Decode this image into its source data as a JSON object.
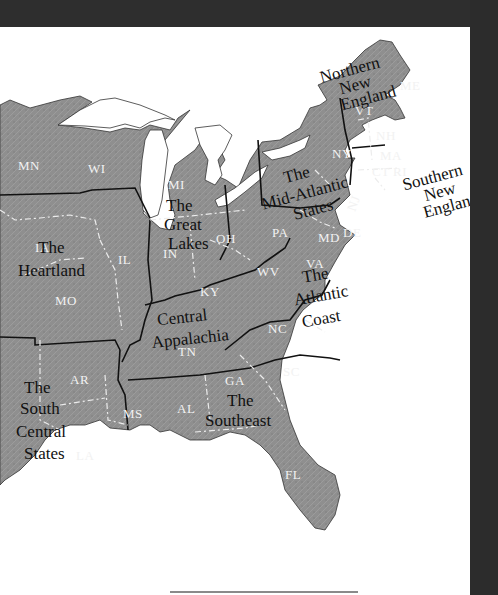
{
  "map": {
    "title": "Regions of the Eastern United States",
    "colors": {
      "land": "#8e8e8e",
      "land_dark": "#7a7a7a",
      "water": "#ffffff",
      "frame": "#2e2e2e",
      "region_border": "#111111",
      "state_border": "#e8e8e8"
    },
    "regions": [
      {
        "name": "northern-new-england",
        "lines": [
          "Northern",
          "New",
          "England"
        ]
      },
      {
        "name": "southern-new-england",
        "lines": [
          "Southern",
          "New",
          "England"
        ]
      },
      {
        "name": "mid-atlantic",
        "lines": [
          "The",
          "Mid-Atlantic",
          "States"
        ]
      },
      {
        "name": "great-lakes",
        "lines": [
          "The",
          "Great",
          "Lakes"
        ]
      },
      {
        "name": "heartland",
        "lines": [
          "The",
          "Heartland"
        ]
      },
      {
        "name": "central-appalachia",
        "lines": [
          "Central",
          "Appalachia"
        ]
      },
      {
        "name": "atlantic-coast",
        "lines": [
          "The",
          "Atlantic",
          "Coast"
        ]
      },
      {
        "name": "southeast",
        "lines": [
          "The",
          "Southeast"
        ]
      },
      {
        "name": "south-central",
        "lines": [
          "The",
          "South",
          "Central",
          "States"
        ]
      }
    ],
    "states": {
      "MN": "MN",
      "WI": "WI",
      "MI": "MI",
      "IA": "IA",
      "IL": "IL",
      "IN": "IN",
      "OH": "OH",
      "MO": "MO",
      "KY": "KY",
      "WV": "WV",
      "VA": "VA",
      "NC": "NC",
      "TN": "TN",
      "AR": "AR",
      "MS": "MS",
      "AL": "AL",
      "GA": "GA",
      "SC": "SC",
      "LA": "LA",
      "FL": "FL",
      "PA": "PA",
      "NY": "NY",
      "NJ": "NJ",
      "MD": "MD",
      "DE": "DE",
      "VT": "VT",
      "NH": "NH",
      "ME": "ME",
      "MA": "MA",
      "CT": "CT",
      "RI": "RI"
    }
  }
}
